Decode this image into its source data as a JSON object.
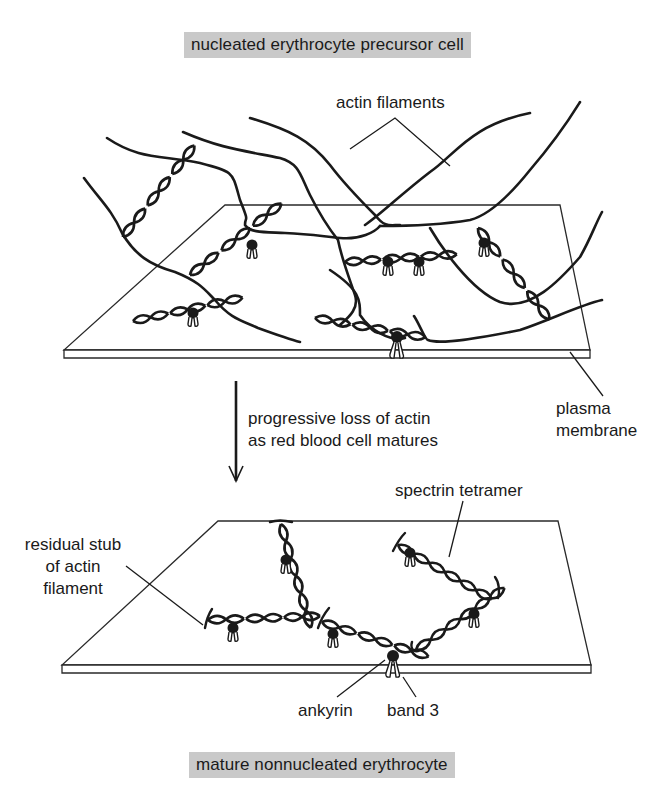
{
  "titles": {
    "top": "nucleated erythrocyte precursor cell",
    "bottom": "mature nonnucleated erythrocyte"
  },
  "labels": {
    "actin_filaments": "actin filaments",
    "plasma_membrane_line1": "plasma",
    "plasma_membrane_line2": "membrane",
    "transition_line1": "progressive loss of actin",
    "transition_line2": "as red blood cell matures",
    "residual_line1": "residual stub",
    "residual_line2": "of actin",
    "residual_line3": "filament",
    "spectrin_tetramer": "spectrin tetramer",
    "ankyrin": "ankyrin",
    "band3": "band 3"
  },
  "colors": {
    "title_background": "#c9c9c9",
    "ink": "#1a1a1a",
    "background": "#ffffff"
  },
  "stages": [
    {
      "name": "nucleated erythrocyte precursor cell",
      "features": [
        "actin filaments",
        "spectrin tetramers",
        "ankyrin",
        "band 3",
        "plasma membrane"
      ]
    },
    {
      "name": "mature nonnucleated erythrocyte",
      "features": [
        "residual stub of actin filament",
        "spectrin tetramer",
        "ankyrin",
        "band 3"
      ]
    }
  ]
}
